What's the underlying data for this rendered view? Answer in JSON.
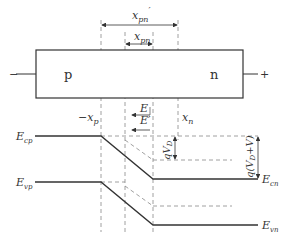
{
  "diagram": {
    "regions": {
      "p_label": "p",
      "n_label": "n"
    },
    "terminals": {
      "left_sign": "−",
      "right_sign": "+"
    },
    "widths": {
      "x_pn_prime": {
        "base": "x",
        "sub": "pn",
        "prime": "′"
      },
      "x_pn": {
        "base": "x",
        "sub": "pn"
      }
    },
    "positions": {
      "neg_xp": {
        "prefix": "−",
        "base": "x",
        "sub": "p"
      },
      "xn": {
        "base": "x",
        "sub": "n"
      }
    },
    "fields": {
      "E": "E",
      "E_prime": "E′"
    },
    "band_labels": {
      "Ecp": {
        "base": "E",
        "sub": "cp"
      },
      "Evp": {
        "base": "E",
        "sub": "vp"
      },
      "Ecn": {
        "base": "E",
        "sub": "cn"
      },
      "Evn": {
        "base": "E",
        "sub": "vn"
      }
    },
    "barriers": {
      "qVD": {
        "q": "q",
        "V": "V",
        "sub": "D"
      },
      "qVDV": {
        "q": "q(",
        "V": "V",
        "sub": "D",
        "rest": "+V)"
      }
    },
    "colors": {
      "line": "#333333",
      "dashed": "#888888"
    }
  }
}
